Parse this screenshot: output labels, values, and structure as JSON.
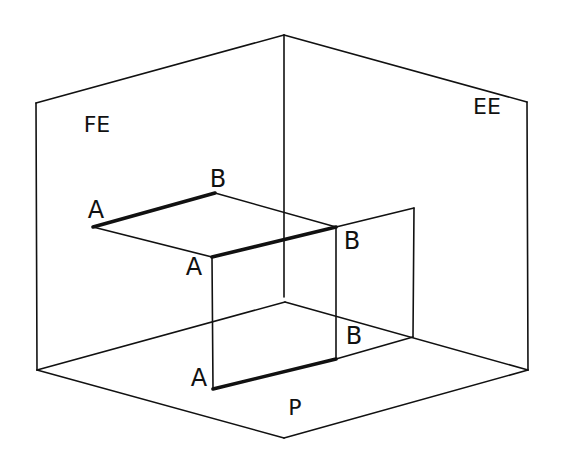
{
  "diagram": {
    "title": "",
    "colors": {
      "line": "#111111",
      "background": "#ffffff"
    },
    "labels": [
      {
        "id": "FE",
        "text": "FE",
        "x": 97,
        "y": 125,
        "size": 22
      },
      {
        "id": "EE",
        "text": "EE",
        "x": 487,
        "y": 107,
        "size": 22
      },
      {
        "id": "P",
        "text": "P",
        "x": 295,
        "y": 408,
        "size": 22
      },
      {
        "id": "A1",
        "text": "A",
        "x": 96,
        "y": 210,
        "size": 24
      },
      {
        "id": "B1",
        "text": "B",
        "x": 218,
        "y": 179,
        "size": 24
      },
      {
        "id": "A2",
        "text": "A",
        "x": 194,
        "y": 267,
        "size": 24
      },
      {
        "id": "B2",
        "text": "B",
        "x": 352,
        "y": 241,
        "size": 24
      },
      {
        "id": "A3",
        "text": "A",
        "x": 199,
        "y": 378,
        "size": 24
      },
      {
        "id": "B3",
        "text": "B",
        "x": 354,
        "y": 336,
        "size": 24
      }
    ],
    "thin_lines": [
      {
        "name": "fe-top-edge",
        "points": [
          [
            36,
            103
          ],
          [
            284,
            35
          ]
        ]
      },
      {
        "name": "ee-top-edge",
        "points": [
          [
            284,
            35
          ],
          [
            527,
            102
          ]
        ]
      },
      {
        "name": "fe-left-edge",
        "points": [
          [
            36,
            103
          ],
          [
            37,
            370
          ]
        ]
      },
      {
        "name": "ee-right-edge",
        "points": [
          [
            527,
            102
          ],
          [
            528,
            370
          ]
        ]
      },
      {
        "name": "center-vertical-edge",
        "points": [
          [
            284,
            35
          ],
          [
            284,
            297
          ]
        ]
      },
      {
        "name": "floor-left-back",
        "points": [
          [
            37,
            370
          ],
          [
            285,
            302
          ]
        ]
      },
      {
        "name": "floor-right-back",
        "points": [
          [
            285,
            302
          ],
          [
            528,
            370
          ]
        ]
      },
      {
        "name": "floor-left-front",
        "points": [
          [
            37,
            370
          ],
          [
            284,
            438
          ]
        ]
      },
      {
        "name": "floor-right-front",
        "points": [
          [
            284,
            438
          ],
          [
            528,
            370
          ]
        ]
      },
      {
        "name": "upper-a-to-mid-a",
        "points": [
          [
            93,
            227
          ],
          [
            212,
            257
          ]
        ]
      },
      {
        "name": "upper-b-to-mid-b",
        "points": [
          [
            215,
            193
          ],
          [
            336,
            227
          ]
        ]
      },
      {
        "name": "mid-a-to-bottom-a",
        "points": [
          [
            212,
            257
          ],
          [
            213,
            389
          ]
        ]
      },
      {
        "name": "mid-b-to-bottom-b",
        "points": [
          [
            336,
            227
          ],
          [
            336,
            359
          ]
        ]
      },
      {
        "name": "ee-plane-top",
        "points": [
          [
            336,
            227
          ],
          [
            414,
            208
          ]
        ]
      },
      {
        "name": "ee-plane-right",
        "points": [
          [
            414,
            208
          ],
          [
            413,
            337
          ]
        ]
      },
      {
        "name": "ee-plane-bottom",
        "points": [
          [
            336,
            359
          ],
          [
            413,
            337
          ]
        ]
      }
    ],
    "thick_lines": [
      {
        "name": "segment-ab-frontal-projection",
        "points": [
          [
            93,
            227
          ],
          [
            215,
            193
          ]
        ]
      },
      {
        "name": "segment-ab-space",
        "points": [
          [
            212,
            257
          ],
          [
            336,
            227
          ]
        ]
      },
      {
        "name": "segment-ab-horizontal-projection",
        "points": [
          [
            213,
            389
          ],
          [
            336,
            359
          ]
        ]
      }
    ]
  }
}
